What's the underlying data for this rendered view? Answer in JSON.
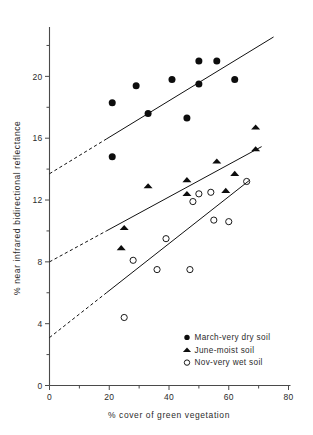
{
  "chart_data": {
    "type": "scatter",
    "title": "",
    "subtitle": "",
    "xlabel": "% cover of green vegetation",
    "ylabel": "% near infrared bidirectional reflectance",
    "xlim": [
      0,
      80
    ],
    "ylim": [
      0,
      23
    ],
    "grid": false,
    "legend_position": "lower-right",
    "x_major_ticks": [
      0,
      20,
      40,
      60,
      80
    ],
    "x_minor_ticks": [
      10,
      30,
      50,
      70
    ],
    "y_major_ticks": [
      0,
      4,
      8,
      12,
      16,
      20
    ],
    "y_minor_ticks": [
      2,
      6,
      10,
      14,
      18,
      22
    ],
    "x_tick_labels": [
      "0",
      "20",
      "40",
      "60",
      "80"
    ],
    "y_tick_labels": [
      "0",
      "4",
      "8",
      "12",
      "16",
      "20"
    ],
    "series": [
      {
        "name": "March - very dry soil",
        "marker": "filled-circle",
        "color": "#0d0d0d",
        "points": [
          {
            "x": 21,
            "y": 18.3
          },
          {
            "x": 21,
            "y": 14.8
          },
          {
            "x": 29,
            "y": 19.4
          },
          {
            "x": 33,
            "y": 17.6
          },
          {
            "x": 41,
            "y": 19.8
          },
          {
            "x": 46,
            "y": 17.3
          },
          {
            "x": 50,
            "y": 21.0
          },
          {
            "x": 50,
            "y": 19.5
          },
          {
            "x": 56,
            "y": 21.0
          },
          {
            "x": 62,
            "y": 19.8
          }
        ],
        "fit_line": {
          "intercept": 13.7,
          "slope": 0.118,
          "solid_from_x": 19,
          "solid_to_x": 75,
          "dashed_from_x": 0,
          "dashed_to_x": 19
        }
      },
      {
        "name": "June - moist soil",
        "marker": "filled-triangle",
        "color": "#0d0d0d",
        "points": [
          {
            "x": 24,
            "y": 8.9
          },
          {
            "x": 25,
            "y": 10.2
          },
          {
            "x": 33,
            "y": 12.9
          },
          {
            "x": 46,
            "y": 13.3
          },
          {
            "x": 46,
            "y": 12.4
          },
          {
            "x": 56,
            "y": 14.5
          },
          {
            "x": 59,
            "y": 12.6
          },
          {
            "x": 62,
            "y": 13.7
          },
          {
            "x": 69,
            "y": 16.7
          },
          {
            "x": 69,
            "y": 15.3
          }
        ],
        "fit_line": {
          "intercept": 8.0,
          "slope": 0.105,
          "solid_from_x": 19,
          "solid_to_x": 71,
          "dashed_from_x": 0,
          "dashed_to_x": 19
        }
      },
      {
        "name": "Nov - very wet soil",
        "marker": "open-circle",
        "color": "#1a1a1a",
        "points": [
          {
            "x": 25,
            "y": 4.4
          },
          {
            "x": 28,
            "y": 8.1
          },
          {
            "x": 36,
            "y": 7.5
          },
          {
            "x": 39,
            "y": 9.5
          },
          {
            "x": 47,
            "y": 7.5
          },
          {
            "x": 48,
            "y": 11.9
          },
          {
            "x": 50,
            "y": 12.4
          },
          {
            "x": 54,
            "y": 12.5
          },
          {
            "x": 55,
            "y": 10.7
          },
          {
            "x": 60,
            "y": 10.6
          },
          {
            "x": 66,
            "y": 13.2
          }
        ],
        "fit_line": {
          "intercept": 3.1,
          "slope": 0.152,
          "solid_from_x": 19,
          "solid_to_x": 67,
          "dashed_from_x": 0,
          "dashed_to_x": 19
        }
      }
    ],
    "legend_entries": [
      {
        "marker": "filled-circle",
        "label": "March-very dry soil"
      },
      {
        "marker": "filled-triangle",
        "label": "June-moist soil"
      },
      {
        "marker": "open-circle",
        "label": "Nov-very wet soil"
      }
    ]
  }
}
